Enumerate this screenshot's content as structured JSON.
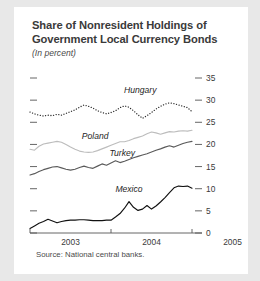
{
  "figure": {
    "title_line1": "Share of Nonresident Holdings of",
    "title_line2": "Government Local Currency Bonds",
    "subtitle": "(In percent)",
    "source": "Source: National central banks."
  },
  "chart_data": {
    "type": "line",
    "title": "Share of Nonresident Holdings of Government Local Currency Bonds",
    "subtitle": "(In percent)",
    "xlabel": "",
    "ylabel": "In percent",
    "ylim": [
      0,
      35
    ],
    "yticks": [
      0,
      5,
      10,
      15,
      20,
      25,
      30,
      35
    ],
    "ytick_labels": [
      "0",
      "5",
      "10",
      "15",
      "20",
      "25",
      "30",
      "35"
    ],
    "y_axis_position": "right",
    "xlim": [
      0,
      36
    ],
    "xticks": [
      0,
      18,
      36
    ],
    "xtick_labels": [
      "2003",
      "2004",
      "2005"
    ],
    "xtick_label_mode": "between-ticks",
    "grid": false,
    "legend": "inline-labels",
    "x": [
      0,
      1,
      2,
      3,
      4,
      5,
      6,
      7,
      8,
      9,
      10,
      11,
      12,
      13,
      14,
      15,
      16,
      17,
      18,
      19,
      20,
      21,
      22,
      23,
      24,
      25,
      26,
      27,
      28,
      29,
      30,
      31,
      32,
      33,
      34,
      35,
      36
    ],
    "series": [
      {
        "name": "Hungary",
        "style": "dotted",
        "color": "#2b2b2b",
        "label_x": 24.5,
        "label_y": 31.6,
        "values": [
          27.3,
          26.9,
          26.6,
          26.4,
          26.6,
          26.5,
          26.8,
          26.6,
          27.0,
          27.4,
          27.8,
          28.4,
          28.9,
          28.6,
          28.2,
          27.6,
          27.2,
          26.9,
          27.2,
          27.6,
          28.3,
          28.7,
          28.4,
          27.6,
          26.7,
          25.9,
          26.5,
          27.2,
          28.0,
          28.6,
          29.1,
          29.4,
          29.2,
          28.9,
          28.6,
          28.3,
          27.4
        ]
      },
      {
        "name": "Poland",
        "style": "solid",
        "color": "#bdbdbd",
        "label_x": 14.5,
        "label_y": 21.3,
        "values": [
          18.9,
          18.7,
          19.6,
          20.1,
          20.3,
          20.5,
          20.7,
          20.5,
          20.0,
          19.4,
          18.9,
          18.5,
          18.3,
          18.2,
          18.3,
          18.6,
          19.0,
          19.4,
          19.8,
          20.2,
          20.6,
          20.6,
          20.9,
          21.3,
          21.6,
          21.9,
          22.4,
          22.8,
          22.6,
          22.3,
          22.6,
          22.9,
          22.8,
          23.0,
          23.1,
          23.0,
          23.2
        ]
      },
      {
        "name": "Turkey",
        "style": "solid",
        "color": "#5a5a5a",
        "label_x": 20.5,
        "label_y": 17.3,
        "values": [
          13.1,
          13.4,
          13.9,
          14.3,
          14.6,
          14.9,
          15.0,
          14.7,
          14.4,
          14.2,
          14.4,
          14.8,
          15.1,
          14.8,
          14.6,
          15.1,
          15.6,
          15.3,
          15.8,
          16.3,
          15.9,
          16.2,
          16.6,
          17.0,
          17.3,
          17.6,
          17.9,
          18.3,
          18.7,
          19.0,
          19.4,
          19.7,
          19.4,
          19.8,
          20.2,
          20.5,
          20.7
        ]
      },
      {
        "name": "Mexico",
        "style": "solid",
        "color": "#111111",
        "label_x": 22.0,
        "label_y": 9.2,
        "values": [
          1.0,
          1.6,
          2.2,
          2.6,
          3.1,
          2.7,
          2.3,
          2.6,
          2.8,
          2.9,
          2.9,
          3.0,
          3.0,
          2.9,
          2.8,
          2.8,
          2.8,
          2.9,
          2.9,
          3.6,
          4.4,
          5.6,
          7.1,
          5.8,
          5.1,
          5.4,
          6.2,
          5.4,
          6.1,
          7.0,
          8.0,
          9.1,
          10.2,
          10.6,
          10.5,
          10.6,
          10.1
        ]
      }
    ]
  }
}
